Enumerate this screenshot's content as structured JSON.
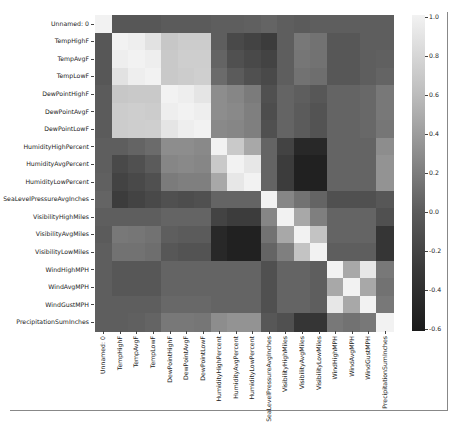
{
  "chart_data": {
    "type": "heatmap",
    "title": "",
    "xlabel": "",
    "ylabel": "",
    "labels": [
      "Unnamed: 0",
      "TempHighF",
      "TempAvgF",
      "TempLowF",
      "DewPointHighF",
      "DewPointAvgF",
      "DewPointLowF",
      "HumidityHighPercent",
      "HumidityAvgPercent",
      "HumidityLowPercent",
      "SeaLevelPressureAvgInches",
      "VisibilityHighMiles",
      "VisibilityAvgMiles",
      "VisibilityLowMiles",
      "WindHighMPH",
      "WindAvgMPH",
      "WindGustMPH",
      "PrecipitationSumInches"
    ],
    "colorbar": {
      "range": [
        -0.6,
        1.0
      ],
      "ticks": [
        "1.0",
        "0.8",
        "0.6",
        "0.4",
        "0.2",
        "0.0",
        "-0.2",
        "-0.4",
        "-0.6"
      ],
      "colormap": "gray"
    },
    "matrix": [
      [
        1.0,
        -0.15,
        -0.15,
        -0.15,
        -0.12,
        -0.12,
        -0.12,
        -0.1,
        -0.1,
        -0.08,
        -0.05,
        -0.1,
        -0.12,
        -0.1,
        -0.1,
        -0.1,
        -0.1,
        -0.1
      ],
      [
        -0.15,
        1.0,
        0.97,
        0.88,
        0.68,
        0.72,
        0.72,
        -0.1,
        -0.25,
        -0.3,
        -0.35,
        -0.1,
        0.1,
        0.05,
        -0.15,
        -0.15,
        -0.1,
        -0.1
      ],
      [
        -0.15,
        0.97,
        1.0,
        0.97,
        0.7,
        0.73,
        0.73,
        -0.05,
        -0.2,
        -0.25,
        -0.3,
        -0.1,
        0.08,
        0.05,
        -0.15,
        -0.15,
        -0.1,
        -0.08
      ],
      [
        -0.15,
        0.88,
        0.97,
        1.0,
        0.7,
        0.72,
        0.74,
        0.0,
        -0.12,
        -0.2,
        -0.25,
        -0.1,
        0.05,
        0.02,
        -0.15,
        -0.15,
        -0.1,
        -0.05
      ],
      [
        -0.12,
        0.68,
        0.7,
        0.7,
        1.0,
        0.97,
        0.9,
        0.25,
        0.2,
        0.12,
        -0.2,
        -0.05,
        -0.1,
        -0.15,
        -0.05,
        -0.05,
        -0.02,
        0.1
      ],
      [
        -0.12,
        0.72,
        0.73,
        0.72,
        0.97,
        1.0,
        0.97,
        0.25,
        0.22,
        0.15,
        -0.22,
        -0.05,
        -0.12,
        -0.18,
        -0.05,
        -0.05,
        -0.02,
        0.1
      ],
      [
        -0.12,
        0.72,
        0.73,
        0.74,
        0.9,
        0.97,
        1.0,
        0.22,
        0.2,
        0.15,
        -0.2,
        -0.05,
        -0.12,
        -0.18,
        -0.05,
        -0.05,
        -0.02,
        0.08
      ],
      [
        -0.1,
        -0.1,
        -0.05,
        0.0,
        0.25,
        0.25,
        0.22,
        1.0,
        0.7,
        0.45,
        -0.05,
        -0.3,
        -0.5,
        -0.5,
        -0.05,
        -0.05,
        -0.05,
        0.25
      ],
      [
        -0.1,
        -0.25,
        -0.2,
        -0.12,
        0.2,
        0.22,
        0.2,
        0.7,
        1.0,
        0.92,
        -0.05,
        -0.35,
        -0.55,
        -0.55,
        -0.05,
        -0.05,
        -0.05,
        0.3
      ],
      [
        -0.08,
        -0.3,
        -0.25,
        -0.2,
        0.12,
        0.15,
        0.15,
        0.45,
        0.92,
        1.0,
        -0.05,
        -0.35,
        -0.55,
        -0.55,
        -0.05,
        -0.05,
        -0.05,
        0.3
      ],
      [
        -0.05,
        -0.35,
        -0.3,
        -0.25,
        -0.2,
        -0.22,
        -0.2,
        -0.05,
        -0.05,
        -0.05,
        1.0,
        0.2,
        0.05,
        -0.05,
        -0.2,
        -0.2,
        -0.2,
        -0.15
      ],
      [
        -0.1,
        -0.1,
        -0.1,
        -0.1,
        -0.05,
        -0.05,
        -0.05,
        -0.3,
        -0.35,
        -0.35,
        0.2,
        1.0,
        0.45,
        0.15,
        -0.05,
        -0.05,
        -0.05,
        -0.2
      ],
      [
        -0.12,
        0.1,
        0.08,
        0.05,
        -0.1,
        -0.12,
        -0.12,
        -0.5,
        -0.55,
        -0.55,
        0.05,
        0.45,
        1.0,
        0.65,
        -0.05,
        -0.05,
        -0.05,
        -0.4
      ],
      [
        -0.1,
        0.05,
        0.05,
        0.02,
        -0.15,
        -0.18,
        -0.18,
        -0.5,
        -0.55,
        -0.55,
        -0.05,
        0.15,
        0.65,
        1.0,
        -0.1,
        -0.1,
        -0.1,
        -0.4
      ],
      [
        -0.1,
        -0.15,
        -0.15,
        -0.15,
        -0.05,
        -0.05,
        -0.05,
        -0.05,
        -0.05,
        -0.05,
        -0.2,
        -0.05,
        -0.05,
        -0.1,
        1.0,
        0.45,
        0.92,
        0.1
      ],
      [
        -0.1,
        -0.15,
        -0.15,
        -0.15,
        -0.05,
        -0.05,
        -0.05,
        -0.05,
        -0.05,
        -0.05,
        -0.2,
        -0.05,
        -0.05,
        -0.1,
        0.45,
        1.0,
        0.45,
        0.05
      ],
      [
        -0.1,
        -0.1,
        -0.1,
        -0.1,
        -0.02,
        -0.02,
        -0.02,
        -0.05,
        -0.05,
        -0.05,
        -0.2,
        -0.05,
        -0.05,
        -0.1,
        0.92,
        0.45,
        1.0,
        0.1
      ],
      [
        -0.1,
        -0.1,
        -0.08,
        -0.05,
        0.1,
        0.1,
        0.08,
        0.25,
        0.3,
        0.3,
        -0.15,
        -0.2,
        -0.4,
        -0.4,
        0.1,
        0.05,
        0.1,
        1.0
      ]
    ],
    "grid": false,
    "legend_position": "right (colorbar)"
  }
}
